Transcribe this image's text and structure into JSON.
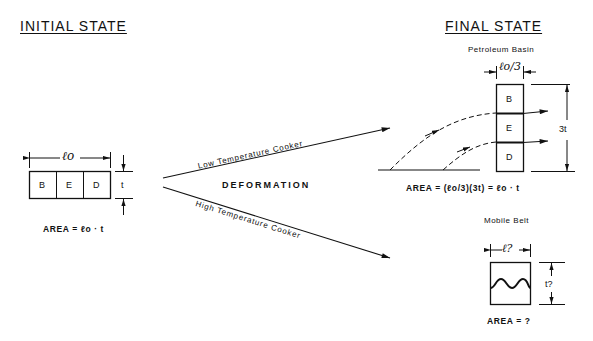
{
  "initial": {
    "title": "INITIAL STATE",
    "length_label": "ℓo",
    "thickness_label": "t",
    "cells": [
      "B",
      "E",
      "D"
    ],
    "area": "AREA = ℓo · t"
  },
  "process": {
    "center_label": "DEFORMATION",
    "upper_path": "Low Temperature Cooker",
    "lower_path": "High Temperature Cooker"
  },
  "final": {
    "title": "FINAL STATE",
    "basin": {
      "name": "Petroleum Basin",
      "width_label": "ℓo/3",
      "height_label": "3t",
      "cells": [
        "B",
        "E",
        "D"
      ],
      "area": "AREA = (ℓo/3)(3t) = ℓo · t"
    },
    "belt": {
      "name": "Mobile Belt",
      "width_label": "ℓ?",
      "height_label": "t?",
      "area": "AREA = ?"
    }
  },
  "colors": {
    "ink": "#111111",
    "background": "#ffffff"
  }
}
